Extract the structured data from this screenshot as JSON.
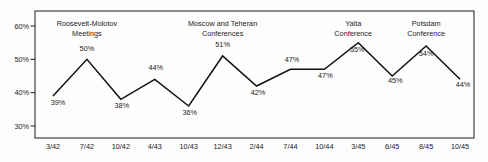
{
  "chart_data": {
    "type": "line",
    "title": "",
    "xlabel": "",
    "ylabel": "",
    "grid": false,
    "legend": null,
    "categories": [
      "3/42",
      "7/42",
      "10/42",
      "4/43",
      "10/43",
      "12/43",
      "2/44",
      "7/44",
      "10/44",
      "3/45",
      "6/45",
      "8/45",
      "10/45"
    ],
    "values": [
      39,
      50,
      38,
      44,
      36,
      51,
      42,
      47,
      47,
      55,
      45,
      54,
      44
    ],
    "point_labels": [
      "39%",
      "50%",
      "38%",
      "44%",
      "36%",
      "51%",
      "42%",
      "47%",
      "47%",
      "55%",
      "45%",
      "54%",
      "44%"
    ],
    "label_offsets": [
      [
        5,
        9
      ],
      [
        0,
        -8.5
      ],
      [
        1,
        8.5
      ],
      [
        1,
        -9
      ],
      [
        1,
        9
      ],
      [
        0,
        -9
      ],
      [
        1.5,
        9
      ],
      [
        1.5,
        -7.5
      ],
      [
        1,
        8.5
      ],
      [
        -1,
        9.5
      ],
      [
        3,
        6.5
      ],
      [
        0,
        10
      ],
      [
        3,
        8
      ]
    ],
    "ylim": [
      26.4,
      64.5
    ],
    "yticks": [
      30,
      40,
      50,
      60
    ],
    "ytick_labels": [
      "30%",
      "40%",
      "50%",
      "60%"
    ],
    "annotations": [
      {
        "lines": [
          "Roosevelt-Molotov",
          "Meetings"
        ],
        "at": 1.0
      },
      {
        "lines": [
          "Moscow and Teheran",
          "Conferences"
        ],
        "at": 5.0
      },
      {
        "lines": [
          "Yalta",
          "Conference"
        ],
        "at": 8.85
      },
      {
        "lines": [
          "Potsdam",
          "Conference"
        ],
        "at": 11.0
      }
    ]
  }
}
